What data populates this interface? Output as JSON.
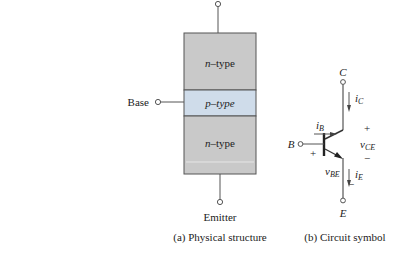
{
  "physical": {
    "layers": [
      {
        "label_var": "n",
        "label_rest": "–type",
        "color": "#c9c9c9"
      },
      {
        "label_var": "p",
        "label_rest": "–type",
        "color": "#cfdcea"
      },
      {
        "label_var": "n",
        "label_rest": "–type",
        "color": "#c9c9c9"
      }
    ],
    "base_label": "Base",
    "emitter_label": "Emitter",
    "caption": "(a) Physical structure"
  },
  "symbol": {
    "collector_label": "C",
    "base_label": "B",
    "emitter_label": "E",
    "ib": {
      "main": "i",
      "sub": "B"
    },
    "ic": {
      "main": "i",
      "sub": "C"
    },
    "ie": {
      "main": "i",
      "sub": "E"
    },
    "vce": {
      "main": "v",
      "sub": "CE",
      "plus": "+",
      "minus": "−"
    },
    "vbe": {
      "main": "v",
      "sub": "BE",
      "plus": "+",
      "minus": "−"
    },
    "caption": "(b) Circuit symbol"
  }
}
